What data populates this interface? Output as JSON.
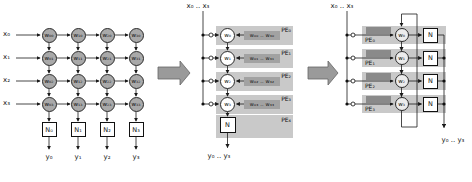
{
  "colors": {
    "wire": "#1a1a1a",
    "node_fill_left": "#a9a9a9",
    "node_fill_right": "#ececec",
    "pe_band": "#c9c9c9",
    "memory_box": "#a2a2a2",
    "memory_box_dark": "#8a8a8a",
    "block_arrow": "#9a9a9a",
    "background": "#ffffff"
  },
  "left_panel": {
    "inputs": [
      "x₀",
      "x₁",
      "x₂",
      "x₃"
    ],
    "weight_rows": [
      [
        "w₀₀",
        "w₁₀",
        "w₂₀",
        "w₃₀"
      ],
      [
        "w₀₁",
        "w₁₁",
        "w₂₁",
        "w₃₁"
      ],
      [
        "w₀₂",
        "w₁₂",
        "w₂₂",
        "w₃₂"
      ],
      [
        "w₀₃",
        "w₁₃",
        "w₂₃",
        "w₃₃"
      ]
    ],
    "neuron_boxes": [
      "N₀",
      "N₁",
      "N₂",
      "N₃"
    ],
    "outputs": [
      "y₀",
      "y₁",
      "y₂",
      "y₃"
    ]
  },
  "middle_panel": {
    "input_label": "x₀ .. x₃",
    "pes": [
      {
        "label": "PE₀",
        "node": "w₀",
        "memory": "w₀₀ .. w₃₀"
      },
      {
        "label": "PE₁",
        "node": "w₁",
        "memory": "w₀₁ .. w₃₁"
      },
      {
        "label": "PE₂",
        "node": "w₂",
        "memory": "w₀₂ .. w₃₂"
      },
      {
        "label": "PE₃",
        "node": "w₃",
        "memory": "w₀₃ .. w₃₃"
      }
    ],
    "output_pe": {
      "label": "PE₄",
      "node": "N"
    },
    "output_label": "y₀ .. y₃"
  },
  "right_panel": {
    "input_label": "x₀ .. x₃",
    "pes": [
      {
        "label": "PE₀",
        "node": "w₀",
        "n_box": "N"
      },
      {
        "label": "PE₁",
        "node": "w₁",
        "n_box": "N"
      },
      {
        "label": "PE₂",
        "node": "w₂",
        "n_box": "N"
      },
      {
        "label": "PE₃",
        "node": "w₃",
        "n_box": "N"
      }
    ],
    "output_label": "y₀ .. y₃"
  }
}
